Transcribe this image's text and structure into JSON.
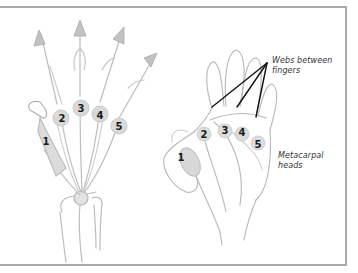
{
  "diagram": {
    "left_hand": {
      "metacarpal_numbers": [
        "1",
        "2",
        "3",
        "4",
        "5"
      ],
      "arrow_count": 4
    },
    "right_hand": {
      "metacarpal_numbers": [
        "1",
        "2",
        "3",
        "4",
        "5"
      ],
      "labels": {
        "webs": "Webs between fingers",
        "webs_line1": "Webs between",
        "webs_line2": "fingers",
        "metacarpal": "Metacarpal heads",
        "metacarpal_line1": "Metacarpal",
        "metacarpal_line2": "heads"
      }
    },
    "colors": {
      "frame": "#a9a9a9",
      "sketch": "#b8b8b8",
      "bone_fill": "#d6d6d6",
      "pointer_line": "#111111",
      "text": "#1a1a1a"
    }
  }
}
